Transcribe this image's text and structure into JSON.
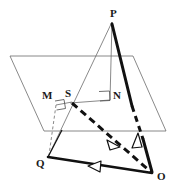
{
  "figure": {
    "kind": "solid-geometry-diagram",
    "canvas": {
      "width": 179,
      "height": 191
    },
    "colors": {
      "stroke_thin": "#5a5a5a",
      "stroke_thick": "#111111",
      "label": "#1a1a1a",
      "background": "#ffffff"
    },
    "points": [
      {
        "id": "P",
        "label": "P",
        "x": 112,
        "y": 22,
        "label_x": 110,
        "label_y": 10
      },
      {
        "id": "Q",
        "label": "Q",
        "x": 48,
        "y": 157,
        "label_x": 38,
        "label_y": 160
      },
      {
        "id": "O",
        "label": "O",
        "x": 152,
        "y": 173,
        "label_x": 157,
        "label_y": 172
      },
      {
        "id": "S",
        "label": "S",
        "x": 72,
        "y": 103,
        "label_x": 66,
        "label_y": 91
      },
      {
        "id": "M",
        "label": "M",
        "x": 62,
        "y": 104,
        "label_x": 43,
        "label_y": 92
      },
      {
        "id": "N",
        "label": "N",
        "x": 110,
        "y": 100,
        "label_x": 114,
        "label_y": 92
      }
    ],
    "plane": {
      "name": "cutting-plane",
      "corners": [
        {
          "x": 10,
          "y": 56
        },
        {
          "x": 133,
          "y": 56
        },
        {
          "x": 166,
          "y": 131
        },
        {
          "x": 44,
          "y": 131
        }
      ]
    },
    "segments": [
      {
        "id": "PQ",
        "from": "P",
        "to": "Q",
        "style": "thin-solid"
      },
      {
        "id": "PN",
        "from": "P",
        "to": "N",
        "style": "thin-solid"
      },
      {
        "id": "SN",
        "from": "S",
        "to": "N",
        "style": "thin-solid"
      },
      {
        "id": "SQ",
        "from": "S",
        "to": "Q",
        "style": "thin-solid"
      },
      {
        "id": "MS",
        "from": "M",
        "to": "S",
        "style": "thin-solid"
      },
      {
        "id": "MQ",
        "from": "M",
        "to": "Q",
        "style": "thin-dashed"
      },
      {
        "id": "PO",
        "from": "P",
        "to": "O",
        "style": "thick-part-dashed"
      },
      {
        "id": "SO",
        "from": "S",
        "to": "O",
        "style": "thick-dashed"
      },
      {
        "id": "QO",
        "from": "Q",
        "to": "O",
        "style": "thick-solid"
      },
      {
        "id": "PQ-thick",
        "from": "P",
        "to": "Q",
        "style": "thick-solid-short"
      }
    ],
    "right_angle_marks": [
      {
        "id": "right-angle-at-M",
        "x": 56,
        "y": 100
      },
      {
        "id": "right-angle-at-N",
        "x": 99,
        "y": 92
      }
    ],
    "arrow_marks": [
      {
        "id": "arrow-on-SO",
        "x": 113,
        "y": 142,
        "direction": "down-right"
      },
      {
        "id": "arrow-on-PO",
        "x": 136,
        "y": 142,
        "direction": "up"
      },
      {
        "id": "arrow-on-QO",
        "x": 96,
        "y": 167,
        "direction": "left"
      }
    ]
  }
}
